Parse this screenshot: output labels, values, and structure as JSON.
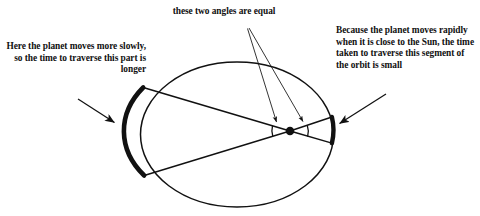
{
  "diagram": {
    "stroke_color": "#111111",
    "background_color": "#ffffff",
    "annotations": {
      "left": "Here the planet moves more slowly, so the time to traverse this part is longer",
      "top": "these two angles are equal",
      "right": "Because the planet moves rapidly when it is close to the Sun, the time taken to traverse this segment of the orbit is small"
    },
    "labels": {
      "ellipse": "orbit-ellipse",
      "sun": "sun-focus-dot",
      "arc_left": "thick-arc-aphelion",
      "arc_right": "thick-arc-perihelion",
      "angle_left": "angle-arc-left",
      "angle_right": "angle-arc-right"
    },
    "geometry": {
      "ellipse_cx": 237,
      "ellipse_cy": 134.5,
      "ellipse_rx": 96.5,
      "ellipse_ry": 72.5,
      "sun_x": 290,
      "sun_y": 131,
      "sun_r": 4.2,
      "arc_left_top_x": 143,
      "arc_left_top_y": 87,
      "arc_left_bottom_x": 144,
      "arc_left_bottom_y": 175,
      "arc_right_top_x": 332,
      "arc_right_top_y": 117,
      "arc_right_bottom_x": 332,
      "arc_right_bottom_y": 143
    }
  }
}
